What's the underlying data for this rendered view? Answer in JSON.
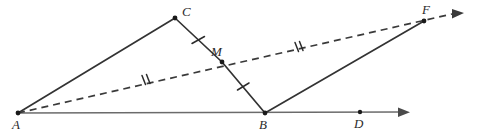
{
  "figure": {
    "kind": "geometry-diagram",
    "width": 477,
    "height": 140,
    "background_color": "#ffffff",
    "solid_stroke_color": "#333333",
    "dashed_stroke_color": "#3a3a3a",
    "baseline_stroke_color": "#6b6b6b",
    "vertex_dot_color": "#1a1a1a"
  },
  "points": {
    "A": {
      "label": "A",
      "x": 18,
      "y": 113,
      "label_x": 12,
      "label_y": 118
    },
    "B": {
      "label": "B",
      "x": 265,
      "y": 113,
      "label_x": 259,
      "label_y": 118
    },
    "C": {
      "label": "C",
      "x": 175,
      "y": 18,
      "label_x": 182,
      "label_y": 6
    },
    "D": {
      "label": "D",
      "x": 360,
      "y": 112,
      "label_x": 354,
      "label_y": 117
    },
    "F": {
      "label": "F",
      "x": 424,
      "y": 21,
      "label_x": 424,
      "label_y": 3
    },
    "M": {
      "label": "M",
      "x": 222,
      "y": 62,
      "label_x": 213,
      "label_y": 46
    }
  },
  "segments": [
    {
      "name": "segment-AC",
      "from": "A",
      "to": "C",
      "style": "solid"
    },
    {
      "name": "segment-CM",
      "from": "C",
      "to": "M",
      "style": "solid",
      "ticks": 1
    },
    {
      "name": "segment-MB",
      "from": "M",
      "to": "B",
      "style": "solid",
      "ticks": 1
    },
    {
      "name": "segment-BF",
      "from": "B",
      "to": "F",
      "style": "solid"
    }
  ],
  "rays": [
    {
      "name": "ray-AD-baseline",
      "from": "A",
      "through": "B",
      "style": "solid",
      "arrow": true,
      "arrow_x": 400,
      "arrow_y": 112
    },
    {
      "name": "ray-AMF-dashed",
      "from": "A",
      "through": "M",
      "style": "dashed",
      "arrow": true,
      "arrow_x": 462,
      "arrow_y": 12,
      "ticks": 2
    }
  ],
  "tick_marks": [
    {
      "name": "tick-CM",
      "on": "segment-CM",
      "count": 1,
      "x": 198,
      "y": 40
    },
    {
      "name": "tick-MB",
      "on": "segment-MB",
      "count": 1,
      "x": 243,
      "y": 87
    },
    {
      "name": "tick-AM",
      "on": "ray-AMF-dashed",
      "count": 2,
      "x": 145,
      "y": 80
    },
    {
      "name": "tick-MF",
      "on": "ray-AMF-dashed",
      "count": 2,
      "x": 298,
      "y": 47
    }
  ],
  "labels_order": [
    "C",
    "M",
    "F",
    "A",
    "B",
    "D"
  ]
}
